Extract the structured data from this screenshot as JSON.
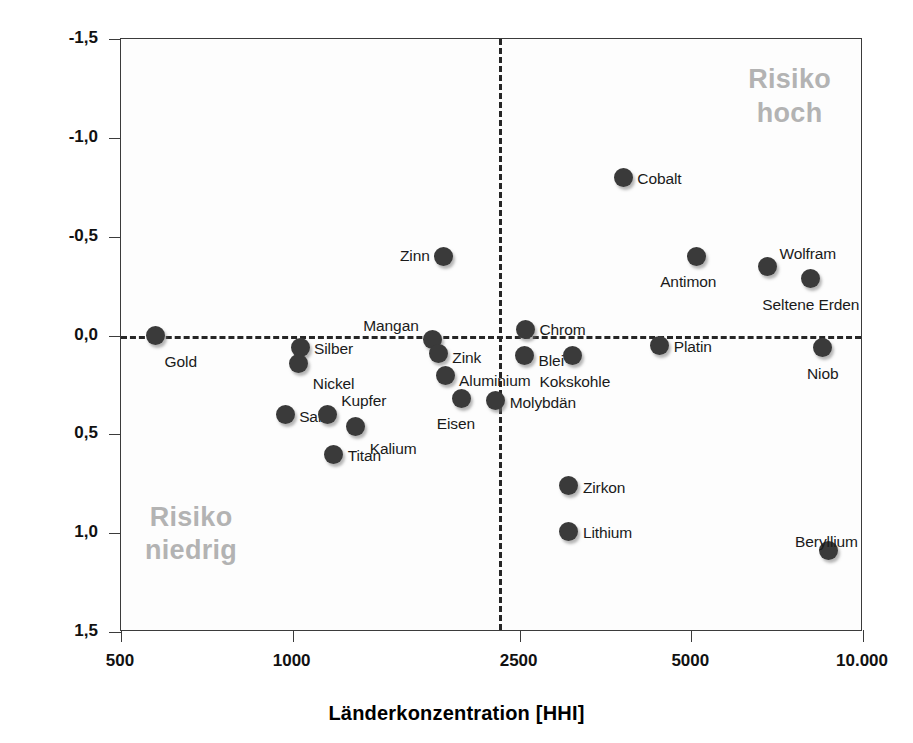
{
  "chart_data": {
    "type": "scatter",
    "title": "",
    "xlabel": "Länderkonzentration [HHI]",
    "ylabel": "Gewichtetes Länderrisiko [GLR]",
    "xscale": "log",
    "xlim": [
      500,
      10000
    ],
    "ylim": [
      -1.5,
      1.5
    ],
    "y_inverted": true,
    "grid": false,
    "legend": "none",
    "x_ticks": [
      "500",
      "1000",
      "2500",
      "5000",
      "10.000"
    ],
    "x_tick_values": [
      500,
      1000,
      2500,
      5000,
      10000
    ],
    "y_ticks": [
      "-1,5",
      "-1,0",
      "-0,5",
      "0,0",
      "0,5",
      "1,0",
      "1,5"
    ],
    "y_tick_values": [
      -1.5,
      -1.0,
      -0.5,
      0.0,
      0.5,
      1.0,
      1.5
    ],
    "reference_lines": [
      {
        "axis": "y",
        "value": 0.0,
        "style": "dashed"
      },
      {
        "axis": "x",
        "value": 2300,
        "style": "dashed"
      }
    ],
    "annotations": [
      {
        "text": "Risiko\nhoch",
        "quadrant": "top-right",
        "color": "#b3b3b3"
      },
      {
        "text": "Risiko\nniedrig",
        "quadrant": "bottom-left",
        "color": "#b3b3b3"
      }
    ],
    "point_color": "#3a3a3a",
    "points": [
      {
        "label": "Gold",
        "x": 575,
        "y": 0.0,
        "lx": 9,
        "ly": 17,
        "pos": "br"
      },
      {
        "label": "Silber",
        "x": 1030,
        "y": 0.06,
        "lx": 14,
        "ly": 2,
        "pos": "r"
      },
      {
        "label": "Nickel",
        "x": 1025,
        "y": 0.14,
        "lx": 14,
        "ly": 12,
        "pos": "br"
      },
      {
        "label": "Salz",
        "x": 970,
        "y": 0.4,
        "lx": 14,
        "ly": 2,
        "pos": "r"
      },
      {
        "label": "Kupfer",
        "x": 1150,
        "y": 0.4,
        "lx": 14,
        "ly": -14,
        "pos": "r"
      },
      {
        "label": "Titan",
        "x": 1180,
        "y": 0.6,
        "lx": 14,
        "ly": 2,
        "pos": "r"
      },
      {
        "label": "Kalium",
        "x": 1290,
        "y": 0.46,
        "lx": 14,
        "ly": 14,
        "pos": "br"
      },
      {
        "label": "Mangan",
        "x": 1760,
        "y": 0.02,
        "lx": -14,
        "ly": -13,
        "pos": "l"
      },
      {
        "label": "Zink",
        "x": 1800,
        "y": 0.09,
        "lx": 14,
        "ly": 5,
        "pos": "r"
      },
      {
        "label": "Aluminium",
        "x": 1850,
        "y": 0.2,
        "lx": 14,
        "ly": 6,
        "pos": "r"
      },
      {
        "label": "Zinn",
        "x": 1840,
        "y": -0.4,
        "lx": -14,
        "ly": 0,
        "pos": "l"
      },
      {
        "label": "Eisen",
        "x": 1980,
        "y": 0.32,
        "lx": -6,
        "ly": 16,
        "pos": "b"
      },
      {
        "label": "Molybdän",
        "x": 2270,
        "y": 0.33,
        "lx": 14,
        "ly": 2,
        "pos": "r"
      },
      {
        "label": "Chrom",
        "x": 2560,
        "y": -0.03,
        "lx": 14,
        "ly": 0,
        "pos": "r"
      },
      {
        "label": "Blei",
        "x": 2550,
        "y": 0.1,
        "lx": 14,
        "ly": 6,
        "pos": "r"
      },
      {
        "label": "Kokskohle",
        "x": 3100,
        "y": 0.1,
        "lx": 2,
        "ly": 18,
        "pos": "b"
      },
      {
        "label": "Zirkon",
        "x": 3050,
        "y": 0.76,
        "lx": 14,
        "ly": 2,
        "pos": "r"
      },
      {
        "label": "Lithium",
        "x": 3050,
        "y": 0.99,
        "lx": 14,
        "ly": 2,
        "pos": "r"
      },
      {
        "label": "Cobalt",
        "x": 3800,
        "y": -0.8,
        "lx": 14,
        "ly": 2,
        "pos": "r"
      },
      {
        "label": "Antimon",
        "x": 5100,
        "y": -0.4,
        "lx": -8,
        "ly": 17,
        "pos": "b"
      },
      {
        "label": "Platin",
        "x": 4400,
        "y": 0.05,
        "lx": 14,
        "ly": 2,
        "pos": "r"
      },
      {
        "label": "Wolfram",
        "x": 6800,
        "y": -0.35,
        "lx": 12,
        "ly": -12,
        "pos": "r"
      },
      {
        "label": "Seltene Erden",
        "x": 8100,
        "y": -0.29,
        "lx": 0,
        "ly": 18,
        "pos": "b"
      },
      {
        "label": "Niob",
        "x": 8500,
        "y": 0.06,
        "lx": 0,
        "ly": 18,
        "pos": "b"
      },
      {
        "label": "Beryllium",
        "x": 8700,
        "y": 1.09,
        "lx": -2,
        "ly": -18,
        "pos": "b"
      }
    ]
  }
}
